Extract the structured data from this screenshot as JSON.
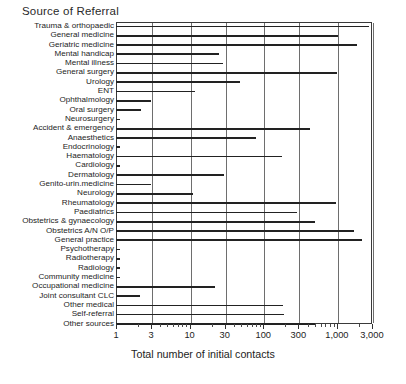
{
  "chart_data": {
    "type": "bar",
    "orientation": "horizontal",
    "title": "Source of Referral",
    "xlabel": "Total number of initial contacts",
    "ylabel": "",
    "xscale": "log",
    "xlim": [
      1,
      3000
    ],
    "grid": true,
    "legend": null,
    "xticks": [
      1,
      3,
      10,
      30,
      100,
      300,
      1000,
      3000
    ],
    "xticklabels": [
      "1",
      "3",
      "10",
      "30",
      "100",
      "300",
      "1,000",
      "3,000"
    ],
    "categories": [
      "Trauma & orthopaedic",
      "General medicine",
      "Geriatric medicine",
      "Mental handicap",
      "Mental illness",
      "General surgery",
      "Urology",
      "ENT",
      "Ophthalmology",
      "Oral surgery",
      "Neurosurgery",
      "Accident & emergency",
      "Anaesthetics",
      "Endocrinology",
      "Haematology",
      "Cardiology",
      "Dermatology",
      "Genito-urin.medicine",
      "Neurology",
      "Rheumatology",
      "Paediatrics",
      "Obstetrics & gynaecology",
      "Obstetrics A/N O/P",
      "General practice",
      "Psychotherapy",
      "Radiotherapy",
      "Radiology",
      "Community medicine",
      "Occupational medicine",
      "Joint consultant CLC",
      "Other medical",
      "Self-referral",
      "Other sources"
    ],
    "values": [
      2700,
      1030,
      1900,
      25,
      28,
      1000,
      48,
      12,
      3.0,
      2.2,
      1.1,
      430,
      80,
      1.1,
      180,
      1.1,
      29,
      3.0,
      11,
      960,
      290,
      500,
      1700,
      2200,
      1.1,
      1.1,
      1.1,
      1.1,
      22,
      2.1,
      185,
      190,
      510
    ],
    "colors": {
      "bar": "#222222",
      "grid": "#6e6e6e",
      "axis": "#3a3a3a",
      "text": "#1d1d1d",
      "background": "#ffffff"
    }
  }
}
